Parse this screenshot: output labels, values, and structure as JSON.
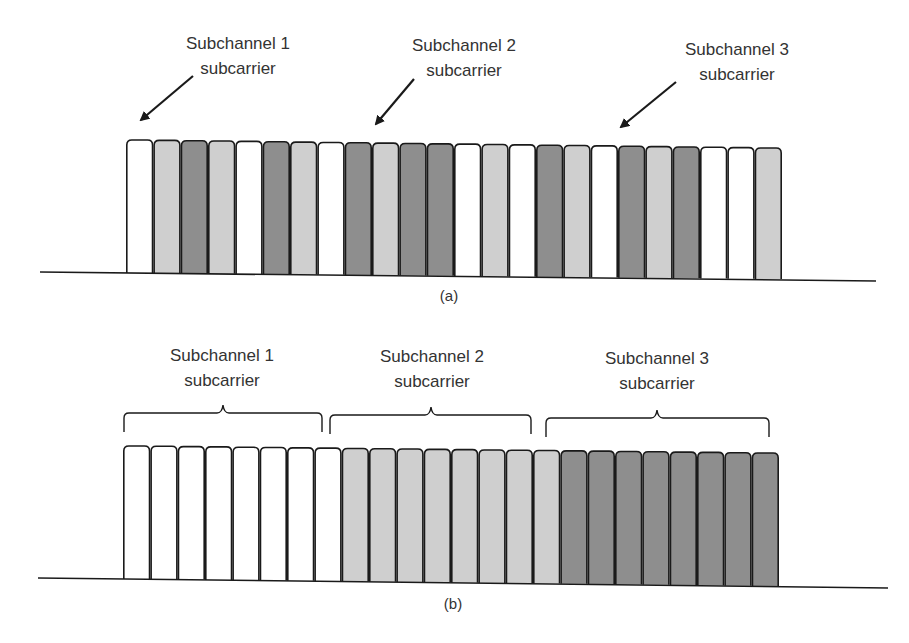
{
  "colors": {
    "W": "#ffffff",
    "L": "#cfcfcf",
    "D": "#8e8e8e",
    "stroke": "#1a1a1a",
    "text": "#333333"
  },
  "panel_a": {
    "caption": "(a)",
    "labels": [
      {
        "line1": "Subchannel 1",
        "line2": "subcarrier"
      },
      {
        "line1": "Subchannel 2",
        "line2": "subcarrier"
      },
      {
        "line1": "Subchannel 3",
        "line2": "subcarrier"
      }
    ],
    "bars": [
      "W",
      "L",
      "D",
      "L",
      "W",
      "D",
      "L",
      "W",
      "D",
      "L",
      "D",
      "D",
      "W",
      "L",
      "W",
      "D",
      "L",
      "W",
      "D",
      "L",
      "D",
      "W",
      "W",
      "L"
    ],
    "legend_note": "W = Subchannel 1, L = Subchannel 2, D = Subchannel 3 (interleaved)"
  },
  "panel_b": {
    "caption": "(b)",
    "labels": [
      {
        "line1": "Subchannel 1",
        "line2": "subcarrier"
      },
      {
        "line1": "Subchannel 2",
        "line2": "subcarrier"
      },
      {
        "line1": "Subchannel 3",
        "line2": "subcarrier"
      }
    ],
    "bars": [
      "W",
      "W",
      "W",
      "W",
      "W",
      "W",
      "W",
      "W",
      "L",
      "L",
      "L",
      "L",
      "L",
      "L",
      "L",
      "L",
      "D",
      "D",
      "D",
      "D",
      "D",
      "D",
      "D",
      "D"
    ],
    "legend_note": "Adjacent (contiguous) subcarrier grouping"
  }
}
